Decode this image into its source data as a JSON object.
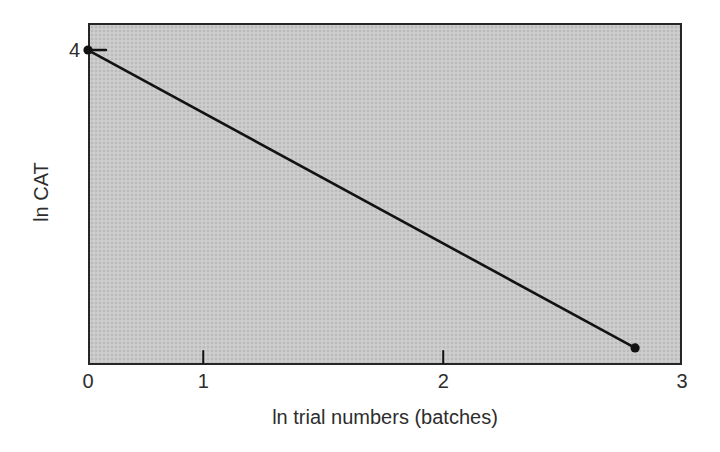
{
  "figure": {
    "background_color": "#ffffff",
    "text_color": "#2d2d2d"
  },
  "chart_data": {
    "type": "line",
    "title": "",
    "xlabel": "ln trial numbers (batches)",
    "ylabel": "ln CAT",
    "xlim": [
      0,
      3
    ],
    "grid": false,
    "legend": "none",
    "plot_fill_color": "#c9c9c9",
    "border_color": "#262626",
    "line_color": "#121212",
    "point_color": "#121212",
    "points": [
      {
        "x": 0,
        "y": 4
      },
      {
        "x": 2.8,
        "y": 0.2
      }
    ],
    "points_frac": [
      {
        "x": 0.0,
        "y": 0.079
      },
      {
        "x": 0.921,
        "y": 0.95
      }
    ],
    "x_ticks": [
      {
        "label": "0",
        "frac": 0.0
      },
      {
        "label": "1",
        "frac": 0.194
      },
      {
        "label": "2",
        "frac": 0.598
      },
      {
        "label": "3",
        "frac": 1.0
      }
    ],
    "y_ticks": [
      {
        "label": "4",
        "frac": 0.079
      }
    ]
  }
}
